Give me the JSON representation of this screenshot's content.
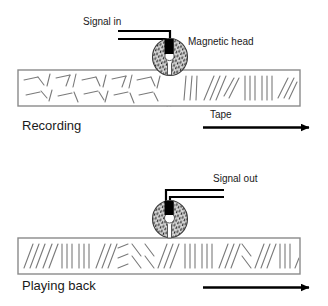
{
  "figure": {
    "background_color": "#ffffff",
    "width": 328,
    "height": 306
  },
  "panels": [
    {
      "id": "recording",
      "caption": "Recording",
      "caption_pos": {
        "x": 22,
        "y": 130
      },
      "signal_label": "Signal in",
      "signal_label_pos": {
        "x": 83,
        "y": 25
      },
      "head_label": "Magnetic head",
      "head_label_pos": {
        "x": 188,
        "y": 45
      },
      "tape_label": "Tape",
      "tape_label_pos": {
        "x": 210,
        "y": 118
      },
      "tape_rect": {
        "x": 18,
        "y": 70,
        "w": 282,
        "h": 36
      },
      "head": {
        "cx": 170,
        "cy": 57,
        "rx": 17,
        "ry": 18,
        "gap_type": "slot",
        "coil_color": "#000000",
        "body_fill": "#d8d8d8",
        "stipple": true,
        "flux_lines": true
      },
      "wires": {
        "direction": "left",
        "color": "#000000"
      },
      "tape_pattern": {
        "left_zone_label": "unrecorded-random-domains",
        "right_zone_label": "recorded-aligned-domains",
        "boundary_x": 172
      },
      "arrow": {
        "x1": 203,
        "y1": 127,
        "x2": 310,
        "y2": 127,
        "label": "Tape"
      }
    },
    {
      "id": "playing-back",
      "caption": "Playing back",
      "caption_pos": {
        "x": 22,
        "y": 290
      },
      "signal_label": "Signal out",
      "signal_label_pos": {
        "x": 213,
        "y": 182
      },
      "head_label": "",
      "tape_label": "",
      "tape_rect": {
        "x": 18,
        "y": 238,
        "w": 282,
        "h": 36
      },
      "head": {
        "cx": 170,
        "cy": 219,
        "rx": 17,
        "ry": 18,
        "gap_type": "hole",
        "coil_color": "#000000",
        "body_fill": "#d8d8d8",
        "stipple": true,
        "flux_lines": false
      },
      "wires": {
        "direction": "right",
        "color": "#000000"
      },
      "tape_pattern": {
        "left_zone_label": "recorded-aligned-domains",
        "right_zone_label": "recorded-aligned-domains",
        "boundary_x": null
      },
      "arrow": {
        "x1": 203,
        "y1": 287,
        "x2": 310,
        "y2": 287,
        "label": ""
      }
    }
  ],
  "colors": {
    "ink": "#1a1a1a",
    "wire": "#000000",
    "tape_border": "#8a8a8a",
    "domain_stroke": "#7a7a7a",
    "head_fill": "#d0d0d0",
    "head_stroke": "#4a4a4a",
    "flux": "#9a9a9a"
  }
}
